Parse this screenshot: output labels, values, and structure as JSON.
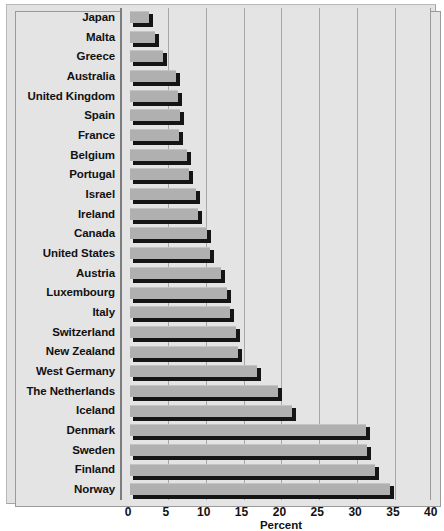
{
  "chart_data": {
    "type": "bar",
    "orientation": "horizontal",
    "title": "",
    "xlabel": "Percent",
    "ylabel": "",
    "xlim": [
      0,
      40
    ],
    "xticks": [
      0,
      5,
      10,
      15,
      20,
      25,
      30,
      35,
      40
    ],
    "xtick_labels": [
      "0",
      "5",
      "10",
      "15",
      "20",
      "25",
      "30",
      "35",
      "40"
    ],
    "grid": true,
    "legend": false,
    "categories": [
      "Japan",
      "Malta",
      "Greece",
      "Australia",
      "United Kingdom",
      "Spain",
      "France",
      "Belgium",
      "Portugal",
      "Israel",
      "Ireland",
      "Canada",
      "United States",
      "Austria",
      "Luxembourg",
      "Italy",
      "Switzerland",
      "New Zealand",
      "West Germany",
      "The Netherlands",
      "Iceland",
      "Denmark",
      "Sweden",
      "Finland",
      "Norway"
    ],
    "values": [
      2.5,
      3.3,
      4.4,
      6.1,
      6.4,
      6.6,
      6.5,
      7.5,
      7.8,
      8.7,
      9.0,
      10.2,
      10.6,
      12.0,
      12.8,
      13.2,
      14.0,
      14.3,
      16.8,
      19.5,
      21.4,
      31.2,
      31.3,
      32.4,
      34.3
    ],
    "bar_face_color": "#b0b0b0",
    "bar_shadow_color": "#151515",
    "plot_background": "#e4e4e4",
    "gridline_color": "#a8a8a8",
    "axis_color": "#7d7d7d"
  }
}
